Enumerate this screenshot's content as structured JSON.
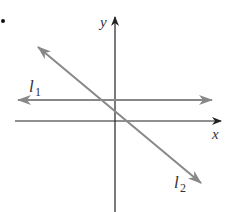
{
  "diagram": {
    "type": "coordinate-plane",
    "axes": {
      "x_label": "x",
      "y_label": "y"
    },
    "lines": [
      {
        "name": "l1",
        "label_main": "l",
        "label_sub": "1",
        "description": "horizontal line above x-axis"
      },
      {
        "name": "l2",
        "label_main": "l",
        "label_sub": "2",
        "description": "line with negative slope"
      }
    ],
    "colors": {
      "axes": "#222222",
      "lines": "#888888",
      "text": "#333333"
    }
  }
}
